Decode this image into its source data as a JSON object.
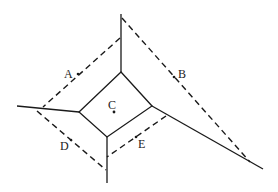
{
  "diagram": {
    "type": "voronoi-dual",
    "labels": {
      "A": "A",
      "B": "B",
      "C": "C",
      "D": "D",
      "E": "E"
    },
    "points": {
      "C": {
        "x": 114,
        "y": 112
      }
    },
    "central_cell_vertices": [
      {
        "x": 121,
        "y": 72
      },
      {
        "x": 79,
        "y": 112
      },
      {
        "x": 107,
        "y": 137
      },
      {
        "x": 152,
        "y": 106
      }
    ],
    "solid_rays": [
      {
        "from": {
          "x": 121,
          "y": 72
        },
        "to": {
          "x": 121,
          "y": 14
        }
      },
      {
        "from": {
          "x": 79,
          "y": 112
        },
        "to": {
          "x": 17,
          "y": 106
        }
      },
      {
        "from": {
          "x": 107,
          "y": 137
        },
        "to": {
          "x": 107,
          "y": 183
        }
      },
      {
        "from": {
          "x": 152,
          "y": 106
        },
        "to": {
          "x": 263,
          "y": 169
        }
      }
    ],
    "dashed_edges": [
      {
        "name": "A",
        "from": {
          "x": 120,
          "y": 38
        },
        "to": {
          "x": 43,
          "y": 107
        }
      },
      {
        "name": "B",
        "from": {
          "x": 122,
          "y": 18
        },
        "to": {
          "x": 250,
          "y": 162
        }
      },
      {
        "name": "D",
        "from": {
          "x": 37,
          "y": 111
        },
        "to": {
          "x": 106,
          "y": 170
        }
      },
      {
        "name": "E",
        "from": {
          "x": 166,
          "y": 116
        },
        "to": {
          "x": 107,
          "y": 157
        }
      }
    ],
    "colors": {
      "line": "#1a1a1a",
      "background": "#ffffff"
    }
  }
}
